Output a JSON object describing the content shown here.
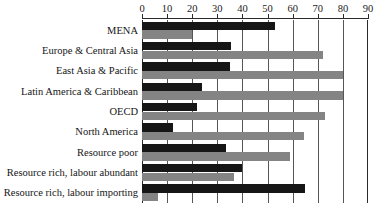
{
  "chart_data": {
    "type": "bar",
    "orientation": "horizontal",
    "title": "",
    "xlabel": "",
    "ylabel": "",
    "xlim": [
      0,
      90
    ],
    "xticks": [
      0,
      10,
      20,
      30,
      40,
      50,
      60,
      70,
      80,
      90
    ],
    "grid": true,
    "legend": "none",
    "categories": [
      "MENA",
      "Europe & Central Asia",
      "East Asia & Pacific",
      "Latin America & Caribbean",
      "OECD",
      "North America",
      "Resource poor",
      "Resource rich, labour abundant",
      "Resource rich, labour importing"
    ],
    "series": [
      {
        "name": "series-a",
        "color": "#161616",
        "values": [
          53,
          35.5,
          35,
          24,
          22,
          12.5,
          33.5,
          40,
          65
        ]
      },
      {
        "name": "series-b",
        "color": "#848484",
        "values": [
          20,
          72,
          80,
          80,
          73,
          64.5,
          59,
          36.5,
          6.5
        ]
      }
    ]
  },
  "axis": {
    "tick_labels": [
      "0",
      "10",
      "20",
      "30",
      "40",
      "50",
      "60",
      "70",
      "80",
      "90"
    ]
  }
}
